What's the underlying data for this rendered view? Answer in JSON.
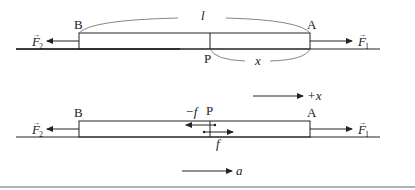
{
  "top_diagram": {
    "labels": {
      "B": "B",
      "A": "A",
      "P": "P",
      "length": "l",
      "x": "x",
      "F1": "F",
      "F1_sub": "1",
      "F2": "F",
      "F2_sub": "2",
      "arrow_mark": "→"
    }
  },
  "axis": {
    "label": "+x"
  },
  "bottom_diagram": {
    "labels": {
      "B": "B",
      "A": "A",
      "P": "P",
      "F1": "F",
      "F1_sub": "1",
      "F2": "F",
      "F2_sub": "2",
      "neg_f": "−f",
      "f": "f",
      "a": "a",
      "arrow_mark": "→"
    }
  },
  "colors": {
    "line": "#222222",
    "curve": "#555555",
    "bottom_rule": "#999999"
  }
}
